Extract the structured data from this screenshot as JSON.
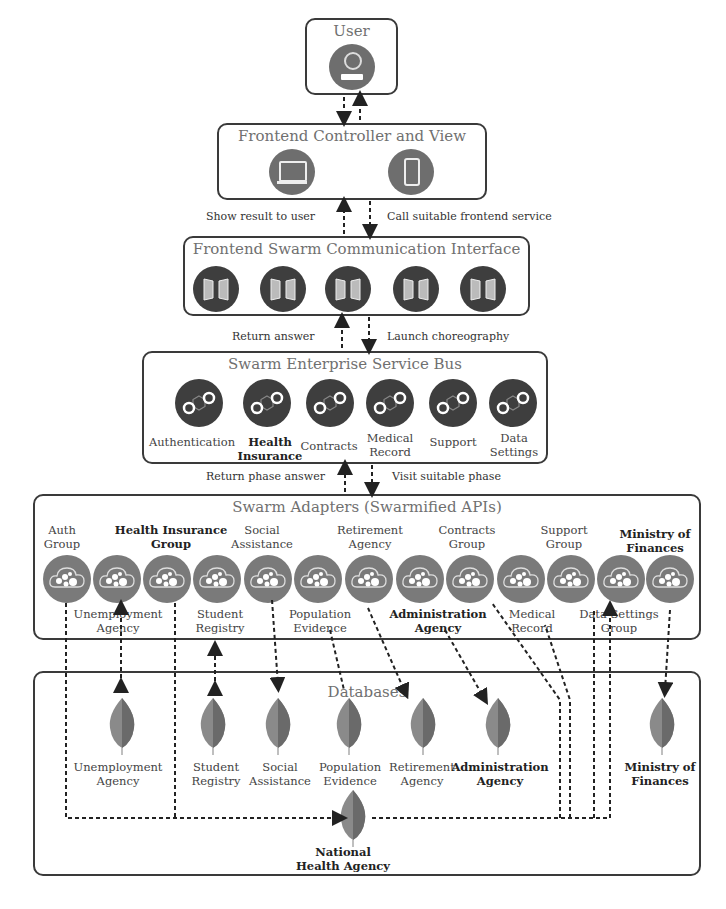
{
  "user_box": {
    "title": "User",
    "icon": "user-icon"
  },
  "frontend_box": {
    "title": "Frontend Controller and View",
    "icons": [
      "laptop-icon",
      "smartphone-icon"
    ]
  },
  "arrows_frontend": {
    "up": "Show result to user",
    "down": "Call suitable frontend service"
  },
  "fsci_box": {
    "title": "Frontend Swarm Communication Interface",
    "icon_count": 5,
    "icon": "door-icon"
  },
  "arrows_fsci": {
    "up": "Return answer",
    "down": "Launch choreography"
  },
  "esb_box": {
    "title": "Swarm Enterprise Service Bus",
    "services": [
      {
        "label": "Authentication",
        "bold": false
      },
      {
        "label": "Health Insurance",
        "bold": true
      },
      {
        "label": "Contracts",
        "bold": false
      },
      {
        "label": "Medical Record",
        "bold": false
      },
      {
        "label": "Support",
        "bold": false
      },
      {
        "label": "Data Settings",
        "bold": false
      }
    ]
  },
  "arrows_esb": {
    "up": "Return phase answer",
    "down": "Visit suitable phase"
  },
  "adapters_box": {
    "title": "Swarm Adapters (Swarmified APIs)",
    "top_labels": [
      {
        "label": "Auth Group",
        "bold": false
      },
      {
        "label": "Health Insurance Group",
        "bold": true
      },
      {
        "label": "Social Assistance",
        "bold": false
      },
      {
        "label": "Retirement Agency",
        "bold": false
      },
      {
        "label": "Contracts Group",
        "bold": false
      },
      {
        "label": "Support Group",
        "bold": false
      },
      {
        "label": "Ministry of Finances",
        "bold": true
      }
    ],
    "bottom_labels": [
      {
        "label": "Unemployment Agency",
        "bold": false
      },
      {
        "label": "Student Registry",
        "bold": false
      },
      {
        "label": "Population Evidence",
        "bold": false
      },
      {
        "label": "Administration Agency",
        "bold": true
      },
      {
        "label": "Medical Record",
        "bold": false
      },
      {
        "label": "Data Settings Group",
        "bold": false
      }
    ],
    "adapter_count": 13
  },
  "databases_box": {
    "title": "Databases",
    "dbs": [
      {
        "label": "Unemployment Agency",
        "bold": false
      },
      {
        "label": "Student Registry",
        "bold": false
      },
      {
        "label": "Social Assistance",
        "bold": false
      },
      {
        "label": "Population Evidence",
        "bold": false
      },
      {
        "label": "Retirement Agency",
        "bold": false
      },
      {
        "label": "Administration Agency",
        "bold": true
      },
      {
        "label": "Ministry of Finances",
        "bold": true
      }
    ],
    "central_db": {
      "label": "National Health Agency",
      "bold": true
    }
  },
  "colors": {
    "border": "#3a3a3a",
    "title_gray": "#707070",
    "icon_dark": "#3e3e3e",
    "adapter_gray": "#7a7a7a",
    "leaf_gray": "#777777"
  }
}
